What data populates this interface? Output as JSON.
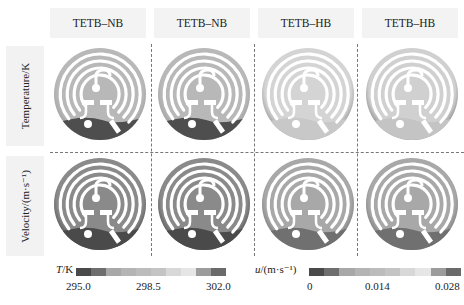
{
  "figure": {
    "columns": [
      {
        "label": "TETB–NB"
      },
      {
        "label": "TETB–NB"
      },
      {
        "label": "TETB–HB"
      },
      {
        "label": "TETB–HB"
      }
    ],
    "rows": [
      {
        "label": "Temperature/K"
      },
      {
        "label": "Velocity/(m·s⁻¹)"
      }
    ]
  },
  "legends": {
    "temperature": {
      "symbol": "T",
      "unit": "/K",
      "ticks": [
        "295.0",
        "298.5",
        "302.0"
      ],
      "colors": [
        "#4a4a4a",
        "#6e6e6e",
        "#a8a8a8",
        "#b4b4b4",
        "#bcbcbc",
        "#c4c4c4",
        "#d8d8d8",
        "#e6e6e6",
        "#9c9c9c",
        "#6a6a6a"
      ]
    },
    "velocity": {
      "symbol": "u",
      "unit": "/(m·s⁻¹)",
      "ticks": [
        "0",
        "0.014",
        "0.028"
      ],
      "colors": [
        "#4a4a4a",
        "#6e6e6e",
        "#a8a8a8",
        "#b4b4b4",
        "#bcbcbc",
        "#c4c4c4",
        "#d8d8d8",
        "#e6e6e6",
        "#9c9c9c",
        "#6a6a6a"
      ]
    }
  },
  "panels": {
    "temperature": [
      {
        "base": "#b8b8b8",
        "low": "#4e4e4e",
        "rim": "#a0a0a0"
      },
      {
        "base": "#b8b8b8",
        "low": "#4e4e4e",
        "rim": "#a0a0a0"
      },
      {
        "base": "#d4d4d4",
        "low": "#c8c8c8",
        "rim": "#9a9a9a"
      },
      {
        "base": "#d0d0d0",
        "low": "#c4c4c4",
        "rim": "#8a8a8a"
      }
    ],
    "velocity": [
      {
        "base": "#8a8a8a",
        "low": "#4a4a4a",
        "rim": "#555555"
      },
      {
        "base": "#8a8a8a",
        "low": "#4a4a4a",
        "rim": "#555555"
      },
      {
        "base": "#a8a8a8",
        "low": "#707070",
        "rim": "#7a7a7a"
      },
      {
        "base": "#a8a8a8",
        "low": "#707070",
        "rim": "#7a7a7a"
      }
    ]
  }
}
